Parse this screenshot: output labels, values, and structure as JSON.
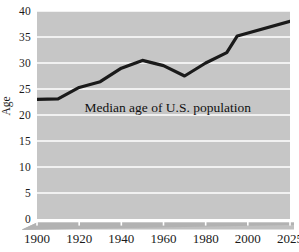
{
  "chart_data": {
    "type": "line",
    "title": "",
    "annotation": "Median age of U.S. population",
    "xlabel": "",
    "ylabel": "Age",
    "grid": "horizontal",
    "legend": "none",
    "plot_background": "#c6c6c6",
    "line_color": "#1a1a1a",
    "gridline_color": "#ffffff",
    "xlim": [
      1900,
      2025
    ],
    "ylim": [
      0,
      40
    ],
    "x_tick_labels": [
      "1900",
      "1920",
      "1940",
      "1960",
      "1980",
      "2000",
      "2025"
    ],
    "x_tick_values": [
      1900,
      1920,
      1940,
      1960,
      1980,
      2000,
      2025
    ],
    "y_tick_labels": [
      "0",
      "5",
      "10",
      "15",
      "20",
      "25",
      "30",
      "35",
      "40"
    ],
    "y_tick_values": [
      0,
      5,
      10,
      15,
      20,
      25,
      30,
      35,
      40
    ],
    "x": [
      1900,
      1910,
      1920,
      1930,
      1940,
      1950,
      1960,
      1970,
      1980,
      1990,
      1995,
      2025
    ],
    "values": [
      23.0,
      23.1,
      25.3,
      26.4,
      29.0,
      30.5,
      29.5,
      27.5,
      30.0,
      32.0,
      35.2,
      38.0
    ],
    "series": [
      {
        "name": "Median age of U.S. population",
        "values": [
          23.0,
          23.1,
          25.3,
          26.4,
          29.0,
          30.5,
          29.5,
          27.5,
          30.0,
          32.0,
          35.2,
          38.0
        ]
      }
    ]
  }
}
